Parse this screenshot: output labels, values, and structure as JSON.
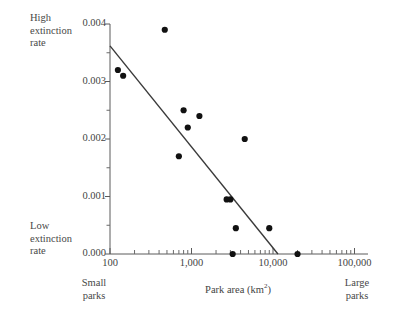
{
  "figure": {
    "left_axis_labels": {
      "high": "High\nextinction\nrate",
      "low": "Low\nextinction\nrate"
    },
    "bottom_labels": {
      "small": "Small\nparks",
      "large": "Large\nparks"
    },
    "xaxis_title_main": "Park area (km",
    "xaxis_title_sup": "2",
    "xaxis_title_close": ")"
  },
  "chart_data": {
    "type": "scatter",
    "title": "",
    "xlabel": "Park area (km2)",
    "ylabel": "",
    "xscale": "log",
    "xlim": [
      100,
      100000
    ],
    "ylim": [
      0.0,
      0.004
    ],
    "grid": false,
    "legend": null,
    "x_tick_labels": [
      "100",
      "1,000",
      "10,000",
      "100,000"
    ],
    "x_tick_values": [
      100,
      1000,
      10000,
      100000
    ],
    "y_tick_labels": [
      "0.000",
      "0.001",
      "0.002",
      "0.003",
      "0.004"
    ],
    "y_tick_values": [
      0.0,
      0.001,
      0.002,
      0.003,
      0.004
    ],
    "y_minor_ticks": [
      0.0005,
      0.0015,
      0.0025,
      0.0035
    ],
    "annotations": {
      "high_extinction": "High extinction rate",
      "low_extinction": "Low extinction rate",
      "small_parks": "Small parks",
      "large_parks": "Large parks"
    },
    "points": [
      {
        "x": 125,
        "y": 0.0032
      },
      {
        "x": 145,
        "y": 0.0031
      },
      {
        "x": 470,
        "y": 0.0039
      },
      {
        "x": 800,
        "y": 0.0025
      },
      {
        "x": 900,
        "y": 0.0022
      },
      {
        "x": 1250,
        "y": 0.0024
      },
      {
        "x": 700,
        "y": 0.0017
      },
      {
        "x": 4500,
        "y": 0.002
      },
      {
        "x": 2700,
        "y": 0.00095
      },
      {
        "x": 3000,
        "y": 0.00095
      },
      {
        "x": 3500,
        "y": 0.00045
      },
      {
        "x": 9000,
        "y": 0.00045
      },
      {
        "x": 3200,
        "y": 0.0
      },
      {
        "x": 20000,
        "y": 0.0
      }
    ],
    "trend_line": {
      "type": "linear-fit",
      "x_start": 100,
      "y_start": 0.00362,
      "x_end": 11500,
      "y_end": 0.0
    }
  }
}
